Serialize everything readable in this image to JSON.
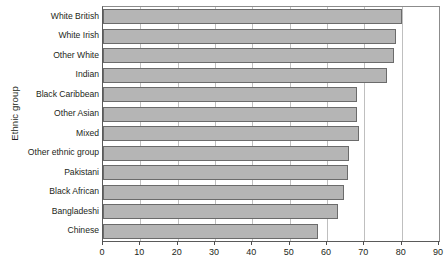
{
  "chart_data": {
    "type": "bar",
    "orientation": "horizontal",
    "title": "",
    "xlabel": "",
    "ylabel": "Ethnic group",
    "xlim": [
      0,
      90
    ],
    "xticks": [
      0,
      10,
      20,
      30,
      40,
      50,
      60,
      70,
      80,
      90
    ],
    "grid": "vertical",
    "legend": "none",
    "categories": [
      "White British",
      "White Irish",
      "Other White",
      "Indian",
      "Black Caribbean",
      "Other Asian",
      "Mixed",
      "Other ethnic group",
      "Pakistani",
      "Black African",
      "Bangladeshi",
      "Chinese"
    ],
    "values": [
      80,
      78.5,
      78,
      76,
      68,
      68,
      68.5,
      66,
      65.5,
      64.5,
      63,
      57.5
    ],
    "bar_fill_color": "#b5b5b5",
    "bar_edge_color": "#6b6b6b"
  }
}
